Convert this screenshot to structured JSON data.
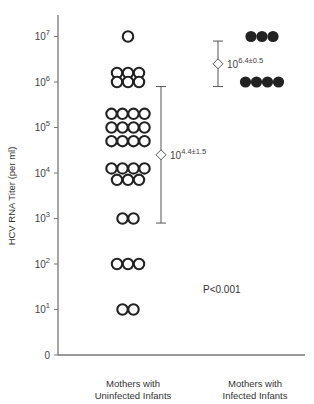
{
  "chart_data": {
    "type": "scatter",
    "title": "",
    "xlabel": "",
    "ylabel": "HCV RNA Titer (per ml)",
    "yscale": "log",
    "y_ticks": [
      "0",
      "10^1",
      "10^2",
      "10^3",
      "10^4",
      "10^5",
      "10^6",
      "10^7"
    ],
    "y_tick_exponents": [
      0,
      1,
      2,
      3,
      4,
      5,
      6,
      7
    ],
    "categories": [
      "Mothers with Uninfected Infants",
      "Mothers with Infected Infants"
    ],
    "series": [
      {
        "name": "Mothers with Uninfected Infants",
        "marker": "open-circle",
        "points_log10": [
          7.0,
          6.2,
          6.2,
          6.2,
          6.0,
          6.0,
          6.0,
          5.3,
          5.3,
          5.3,
          5.3,
          5.0,
          5.0,
          5.0,
          5.0,
          4.7,
          4.7,
          4.7,
          4.7,
          4.1,
          4.1,
          4.1,
          4.1,
          3.85,
          3.85,
          3.85,
          3.0,
          3.0,
          2.0,
          2.0,
          2.0,
          1.0,
          1.0
        ],
        "mean_label": "10",
        "mean_exp": "4.4±1.5",
        "mean_log10": 4.4,
        "sd_log10": 1.5
      },
      {
        "name": "Mothers with Infected Infants",
        "marker": "filled-circle",
        "points_log10": [
          7.0,
          7.0,
          7.0,
          6.0,
          6.0,
          6.0,
          6.0
        ],
        "mean_label": "10",
        "mean_exp": "6.4±0.5",
        "mean_log10": 6.4,
        "sd_log10": 0.5
      }
    ],
    "annotations": [
      "P<0.001"
    ],
    "grid": false,
    "legend": "none"
  },
  "labels": {
    "ylabel": "HCV RNA Titer (per ml)",
    "cat1_line1": "Mothers with",
    "cat1_line2": "Uninfected Infants",
    "cat2_line1": "Mothers with",
    "cat2_line2": "Infected Infants",
    "pvalue": "P<0.001"
  }
}
